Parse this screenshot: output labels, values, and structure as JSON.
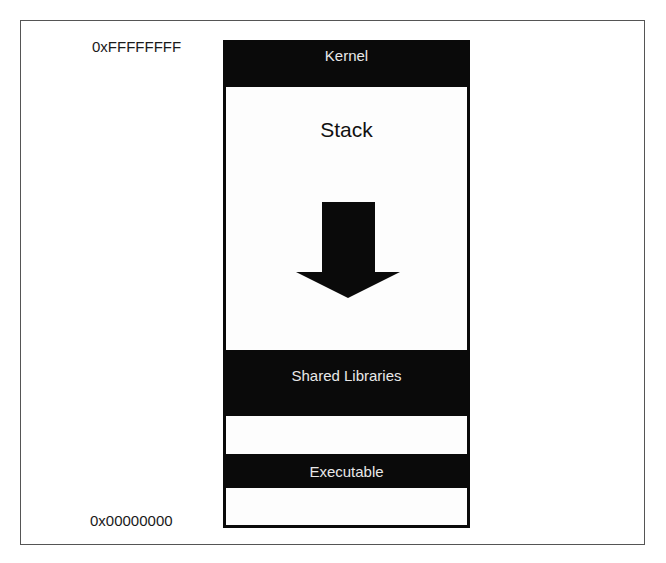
{
  "diagram": {
    "addresses": {
      "top": "0xFFFFFFFF",
      "bottom": "0x00000000"
    },
    "segments": [
      {
        "label": "Kernel",
        "fill": "#0a0a0a"
      },
      {
        "label": "Stack",
        "fill": "#ffffff",
        "growth": "downward"
      },
      {
        "label": "Shared Libraries",
        "fill": "#0a0a0a"
      },
      {
        "label": "",
        "fill": "#ffffff"
      },
      {
        "label": "Executable",
        "fill": "#0a0a0a"
      },
      {
        "label": "",
        "fill": "#ffffff"
      }
    ],
    "arrow": {
      "direction": "down",
      "icon": "arrow-down-icon"
    }
  }
}
